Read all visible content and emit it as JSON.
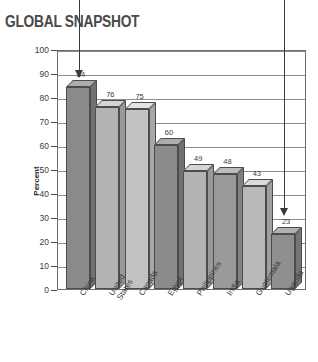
{
  "title": "GLOBAL SNAPSHOT",
  "chart_data": {
    "type": "bar",
    "title": "GLOBAL SNAPSHOT",
    "xlabel": "",
    "ylabel": "Percent",
    "ylim": [
      0,
      100
    ],
    "ytick_step": 10,
    "yticks": [
      100,
      90,
      80,
      70,
      60,
      50,
      40,
      30,
      20,
      10,
      0
    ],
    "grid": true,
    "legend": "none",
    "style": "3d-bars",
    "categories": [
      "China",
      "United States",
      "Canada",
      "Egypt",
      "Philippines",
      "India",
      "Guatemala",
      "Uganda"
    ],
    "category_lines": [
      [
        "China"
      ],
      [
        "United",
        "States"
      ],
      [
        "Canada"
      ],
      [
        "Egypt"
      ],
      [
        "Philippines"
      ],
      [
        "India"
      ],
      [
        "Guatemala"
      ],
      [
        "Uganda"
      ]
    ],
    "values": [
      84,
      76,
      75,
      60,
      49,
      48,
      43,
      23
    ],
    "value_labels": [
      "84",
      "76",
      "75",
      "60",
      "49",
      "48",
      "43",
      "23"
    ],
    "bar_colors": [
      "#8b8b8b",
      "#b3b3b3",
      "#c2c2c2",
      "#8b8b8b",
      "#b3b3b3",
      "#9a9a9a",
      "#b9b9b9",
      "#8f8f8f"
    ],
    "annotations": [
      {
        "name": "arrow-china",
        "target": "China",
        "direction": "down"
      },
      {
        "name": "arrow-uganda",
        "target": "Uganda",
        "direction": "down"
      }
    ]
  },
  "colors": {
    "bar_front_default": "#8b8b8b",
    "bar_top_tint": "#cfcfcf",
    "bar_side_shade": "#6f6f6f",
    "grid": "#8a8a8a",
    "frame": "#6e6e6e",
    "text": "#3a3a3a",
    "title": "#4a4a4a"
  }
}
